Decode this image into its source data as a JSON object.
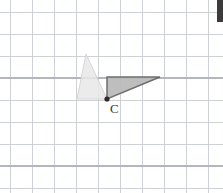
{
  "figure": {
    "background_color": "#ffffff",
    "width": 223,
    "height": 193,
    "grid": {
      "visible": true,
      "cell_size": 22,
      "origin_x": 10,
      "origin_y": 12,
      "columns": 9,
      "rows": 8,
      "line_color": "#c9ccd1",
      "strong_line_color": "#b4b8be",
      "strong_rows": [
        3,
        7
      ],
      "strong_columns": []
    },
    "labels": [
      {
        "id": "point-c-label",
        "text": "C",
        "x": 110,
        "y": 113,
        "color": "#3a3a3a"
      }
    ],
    "points": [
      {
        "id": "point-c",
        "name": "C",
        "x": 107,
        "y": 99,
        "radius": 2.6,
        "color": "#2b2b2b"
      }
    ],
    "shapes": [
      {
        "id": "triangle-preimage",
        "role": "preimage",
        "label": "lightly shaded triangle",
        "fill": "#e8e8e8",
        "stroke": "#d2d2d2",
        "points": "86,54 107,99 77,99",
        "vertices": [
          {
            "x": 86,
            "y": 54
          },
          {
            "x": 107,
            "y": 99
          },
          {
            "x": 77,
            "y": 99
          }
        ]
      },
      {
        "id": "triangle-image",
        "role": "image",
        "label": "dark shaded triangle",
        "fill": "#b9b9b9",
        "stroke": "#6e6e6e",
        "points": "107,99 107,77 160,77",
        "vertices": [
          {
            "x": 107,
            "y": 99
          },
          {
            "x": 107,
            "y": 77
          },
          {
            "x": 160,
            "y": 77
          }
        ]
      }
    ],
    "edge_marker": {
      "visible": true,
      "color": "#3b3b3b",
      "width": 6,
      "height": 22
    }
  }
}
